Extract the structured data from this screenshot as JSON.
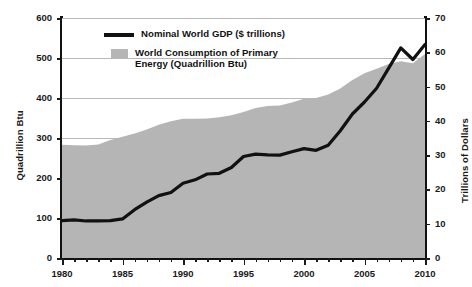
{
  "chart_data": {
    "type": "area",
    "title": "",
    "xlabel": "",
    "ylabel": "Quadrillion Btu",
    "ylabel_right": "Trillions of Dollars",
    "xlim": [
      1980,
      2010
    ],
    "ylim": [
      0,
      600
    ],
    "ylim_right": [
      0,
      70
    ],
    "grid": true,
    "legend_position": "top-center",
    "x": [
      1980,
      1981,
      1982,
      1983,
      1984,
      1985,
      1986,
      1987,
      1988,
      1989,
      1990,
      1991,
      1992,
      1993,
      1994,
      1995,
      1996,
      1997,
      1998,
      1999,
      2000,
      2001,
      2002,
      2003,
      2004,
      2005,
      2006,
      2007,
      2008,
      2009,
      2010
    ],
    "series": [
      {
        "name": "World Consumption of Primary Energy (Quadrillion Btu)",
        "axis": "left",
        "render": "area",
        "color": "#b5b5b5",
        "values": [
          283,
          282,
          281,
          284,
          295,
          303,
          311,
          321,
          333,
          342,
          348,
          348,
          349,
          352,
          357,
          365,
          375,
          380,
          381,
          389,
          398,
          400,
          409,
          424,
          445,
          462,
          473,
          485,
          492,
          487,
          510
        ]
      },
      {
        "name": "Nominal World GDP ($ trillions)",
        "axis": "right",
        "render": "line",
        "color": "#111111",
        "values": [
          10.9,
          11.1,
          10.8,
          10.8,
          10.9,
          11.4,
          14.1,
          16.3,
          18.2,
          19.1,
          21.8,
          22.8,
          24.5,
          24.7,
          26.4,
          29.6,
          30.3,
          30.1,
          30.0,
          31.0,
          31.9,
          31.4,
          32.9,
          37.1,
          42.0,
          45.5,
          49.5,
          55.4,
          61.3,
          57.9,
          62.3
        ]
      }
    ],
    "yticks_left": [
      0,
      100,
      200,
      300,
      400,
      500,
      600
    ],
    "yticks_right": [
      0,
      10,
      20,
      30,
      40,
      50,
      60,
      70
    ],
    "xticks_major": [
      1980,
      1985,
      1990,
      1995,
      2000,
      2005,
      2010
    ],
    "xticks_minor": [
      1981,
      1982,
      1983,
      1984,
      1986,
      1987,
      1988,
      1989,
      1991,
      1992,
      1993,
      1994,
      1996,
      1997,
      1998,
      1999,
      2001,
      2002,
      2003,
      2004,
      2006,
      2007,
      2008,
      2009
    ],
    "legend": [
      {
        "label": "Nominal World GDP ($ trillions)",
        "marker": "line",
        "color": "#111111"
      },
      {
        "label": "World Consumption of Primary Energy (Quadrillion Btu)",
        "marker": "swatch",
        "color": "#b5b5b5"
      }
    ]
  },
  "legend_display": {
    "gdp_label": "Nominal World GDP ($ trillions)",
    "energy_label_line1": "World Consumption of Primary",
    "energy_label_line2": "Energy (Quadrillion Btu)"
  },
  "axes": {
    "left_title": "Quadrillion Btu",
    "right_title": "Trillions of Dollars"
  },
  "colors": {
    "area_fill": "#b5b5b5",
    "line": "#111111",
    "gridline": "#b9b9b9",
    "axis": "#111111",
    "text": "#1a1a1a"
  }
}
